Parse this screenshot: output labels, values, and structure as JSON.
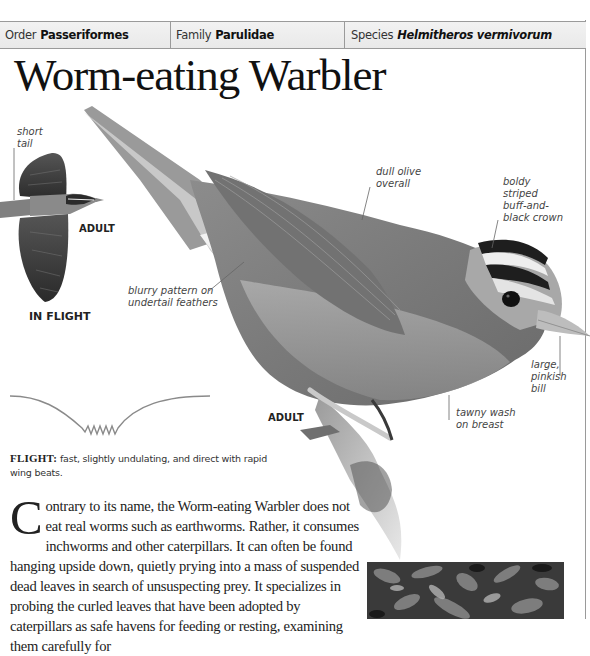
{
  "taxonomy": {
    "order": {
      "label": "Order",
      "value": "Passeriformes"
    },
    "family": {
      "label": "Family",
      "value": "Parulidae"
    },
    "species": {
      "label": "Species",
      "value": "Helmitheros vermivorum"
    }
  },
  "title": "Worm-eating Warbler",
  "in_flight_figure": {
    "callouts": [
      {
        "id": "short-tail",
        "line1": "short",
        "line2": "tail"
      }
    ],
    "age_label": "ADULT",
    "caption": "IN FLIGHT"
  },
  "main_figure": {
    "age_label": "ADULT",
    "callouts": [
      {
        "id": "dull-olive",
        "lines": [
          "dull olive",
          "overall"
        ]
      },
      {
        "id": "crown",
        "lines": [
          "boldy",
          "striped",
          "buff-and-",
          "black crown"
        ]
      },
      {
        "id": "undertail",
        "lines": [
          "blurry pattern on",
          "undertail feathers"
        ]
      },
      {
        "id": "bill",
        "lines": [
          "large,",
          "pinkish",
          "bill"
        ]
      },
      {
        "id": "breast",
        "lines": [
          "tawny wash",
          "on breast"
        ]
      }
    ]
  },
  "flight": {
    "heading": "FLIGHT:",
    "text": "fast, slightly undulating, and direct with rapid wing beats."
  },
  "description": {
    "drop_cap": "C",
    "text": "ontrary to its name, the Worm-eating Warbler does not eat real worms such as earthworms. Rather, it consumes inchworms and other caterpillars. It can often be found hanging upside down, quietly prying into a mass of suspended dead leaves in search of unsuspecting prey. It specializes in probing the curled leaves that have been adopted by caterpillars as safe havens for feeding or resting, examining them carefully for"
  },
  "colors": {
    "bar_bg": "#ececec",
    "rule": "#9a9a9a",
    "flight_path": "#8a8a8a"
  }
}
